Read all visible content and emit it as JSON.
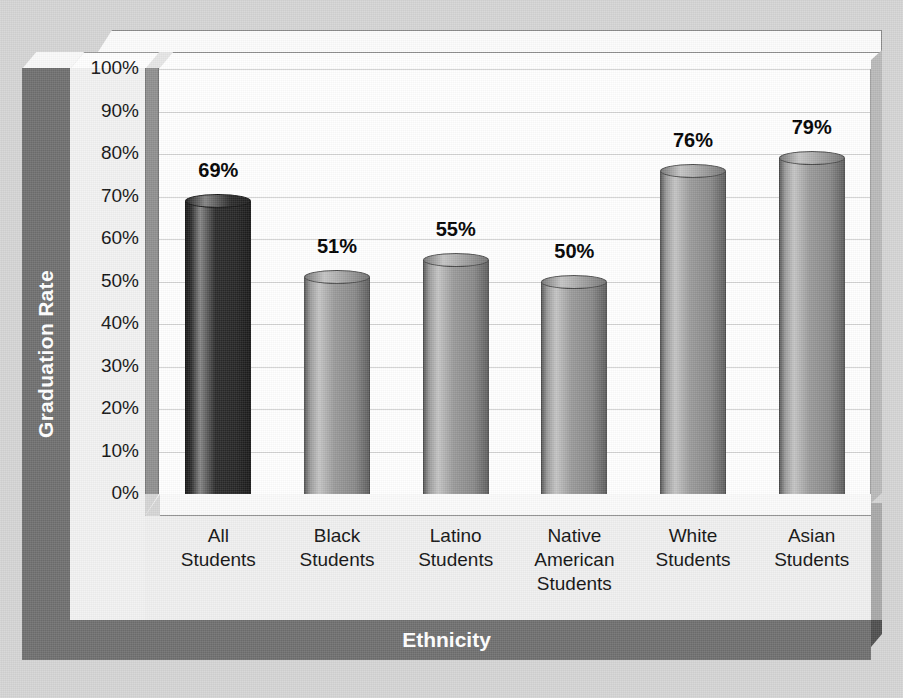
{
  "chart_data": {
    "type": "bar",
    "title": "",
    "xlabel": "Ethnicity",
    "ylabel": "Graduation Rate",
    "categories": [
      "All\nStudents",
      "Black\nStudents",
      "Latino\nStudents",
      "Native\nAmerican\nStudents",
      "White\nStudents",
      "Asian\nStudents"
    ],
    "values": [
      69,
      51,
      55,
      50,
      76,
      79
    ],
    "value_labels": [
      "69%",
      "51%",
      "55%",
      "50%",
      "76%",
      "79%"
    ],
    "ylim": [
      0,
      100
    ],
    "ytick_labels": [
      "100%",
      "90%",
      "80%",
      "70%",
      "60%",
      "50%",
      "40%",
      "30%",
      "20%",
      "10%",
      "0%"
    ],
    "ytick_values": [
      100,
      90,
      80,
      70,
      60,
      50,
      40,
      30,
      20,
      10,
      0
    ],
    "grid": true,
    "legend": "none",
    "series_colors": [
      "#2b2b2b",
      "#9a9a9a",
      "#9a9a9a",
      "#9a9a9a",
      "#9a9a9a",
      "#9a9a9a"
    ],
    "style": "3d-cylinder",
    "background_color": "#d5d5d5",
    "plot_background_color": "#ffffff",
    "axis_band_color": "#6f6f6f",
    "axis_title_text_color": "#ffffff",
    "gridline_color": "#d3d3d3",
    "baseline_color": "#6b6b6b",
    "highlight_color": "#c9c9c9"
  },
  "axis": {
    "y_title": "Graduation Rate",
    "x_title": "Ethnicity"
  }
}
